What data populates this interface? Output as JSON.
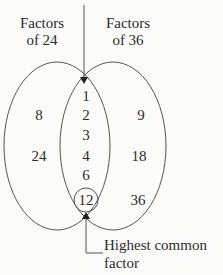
{
  "diagram": {
    "type": "venn",
    "sets": [
      {
        "id": "left",
        "label_line1": "Factors",
        "label_line2": "of 24",
        "only": [
          "8",
          "24"
        ]
      },
      {
        "id": "right",
        "label_line1": "Factors",
        "label_line2": "of 36",
        "only": [
          "9",
          "18",
          "36"
        ]
      }
    ],
    "intersection": [
      "1",
      "2",
      "3",
      "4",
      "6",
      "12"
    ],
    "highlighted": "12",
    "callout": {
      "line1": "Highest common",
      "line2": "factor"
    },
    "colors": {
      "stroke": "#555555",
      "text": "#2c2c2c",
      "background": "#fbfbfa"
    }
  }
}
